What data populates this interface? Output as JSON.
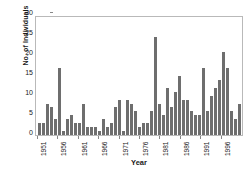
{
  "chart_data": {
    "type": "bar",
    "title": "",
    "xlabel": "Year",
    "ylabel": "No. of Individuals",
    "ylim": [
      0,
      30
    ],
    "yticks": [
      0,
      5,
      10,
      15,
      20,
      25,
      30
    ],
    "xtick_labels": [
      "1951",
      "1956",
      "1961",
      "1966",
      "1971",
      "1976",
      "1981",
      "1986",
      "1991",
      "1996"
    ],
    "xtick_step": 5,
    "grid": false,
    "legend": null,
    "bar_color": "#6e6e6e",
    "frame_color": "#b9b9b9",
    "categories": [
      "1951",
      "1952",
      "1953",
      "1954",
      "1955",
      "1956",
      "1957",
      "1958",
      "1959",
      "1960",
      "1961",
      "1962",
      "1963",
      "1964",
      "1965",
      "1966",
      "1967",
      "1968",
      "1969",
      "1970",
      "1971",
      "1972",
      "1973",
      "1974",
      "1975",
      "1976",
      "1977",
      "1978",
      "1979",
      "1980",
      "1981",
      "1982",
      "1983",
      "1984",
      "1985",
      "1986",
      "1987",
      "1988",
      "1989",
      "1990",
      "1991",
      "1992",
      "1993",
      "1994",
      "1995",
      "1996",
      "1997",
      "1998",
      "1999"
    ],
    "values": [
      3,
      3,
      8,
      7,
      4,
      17,
      1,
      4,
      5,
      3,
      3,
      8,
      2,
      2,
      2,
      1,
      4,
      2,
      3,
      7,
      9,
      1,
      9,
      8,
      6,
      2,
      3,
      3,
      6,
      25,
      8,
      5,
      12,
      7,
      11,
      15,
      9,
      9,
      6,
      5,
      5,
      17,
      6,
      10,
      12,
      14,
      21,
      17,
      6
    ],
    "values_tail": [
      4,
      8
    ]
  }
}
